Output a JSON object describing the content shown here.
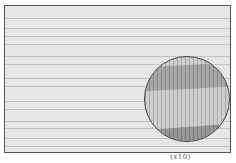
{
  "figure": {
    "magnification_label": "(x10)",
    "grain_lines_y": [
      12,
      22,
      30,
      38,
      50,
      58,
      72,
      80,
      95,
      103,
      115,
      122,
      132,
      140
    ]
  }
}
